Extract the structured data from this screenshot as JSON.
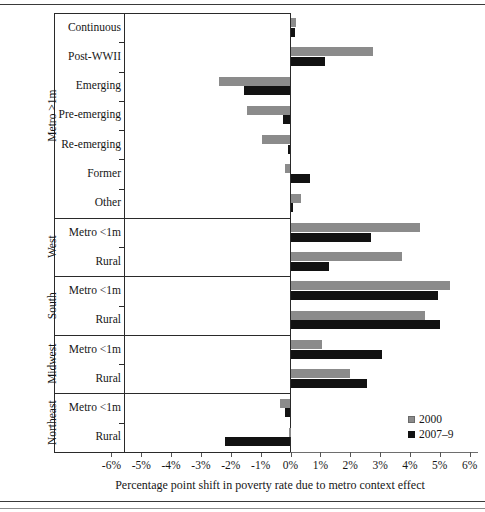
{
  "chart_data": {
    "type": "bar",
    "orientation": "horizontal",
    "title": "",
    "xlabel": "Percentage point shift in poverty rate due to metro context effect",
    "ylabel": "",
    "xlim": [
      -6,
      6
    ],
    "xticks": [
      "-6%",
      "-5%",
      "-4%",
      "-3%",
      "-2%",
      "-1%",
      "0%",
      "1%",
      "2%",
      "3%",
      "4%",
      "5%",
      "6%"
    ],
    "xtick_values": [
      -6,
      -5,
      -4,
      -3,
      -2,
      -1,
      0,
      1,
      2,
      3,
      4,
      5,
      6
    ],
    "grid": false,
    "legend_position": "bottom-right",
    "legend": [
      "2000",
      "2007–9"
    ],
    "categories": [
      "Continuous",
      "Post-WWII",
      "Emerging",
      "Pre-emerging",
      "Re-emerging",
      "Former",
      "Other",
      "Metro <1m",
      "Rural",
      "Metro <1m",
      "Rural",
      "Metro <1m",
      "Rural",
      "Metro <1m",
      "Rural"
    ],
    "groups": [
      {
        "label": "Metro >1m",
        "start": 0,
        "count": 7
      },
      {
        "label": "West",
        "start": 7,
        "count": 2
      },
      {
        "label": "South",
        "start": 9,
        "count": 2
      },
      {
        "label": "Midwest",
        "start": 11,
        "count": 2
      },
      {
        "label": "Northeast",
        "start": 13,
        "count": 2
      }
    ],
    "series": [
      {
        "name": "2000",
        "color": "#8b8b8b",
        "values": [
          0.2,
          2.75,
          -2.4,
          -1.45,
          -0.95,
          -0.2,
          0.35,
          4.35,
          3.75,
          5.35,
          4.5,
          1.05,
          2.0,
          -0.35,
          -0.05
        ]
      },
      {
        "name": "2007–9",
        "color": "#121212",
        "values": [
          0.15,
          1.15,
          -1.55,
          -0.25,
          -0.1,
          0.65,
          0.1,
          2.7,
          1.3,
          4.95,
          5.0,
          3.05,
          2.55,
          -0.2,
          -2.2
        ]
      }
    ]
  }
}
